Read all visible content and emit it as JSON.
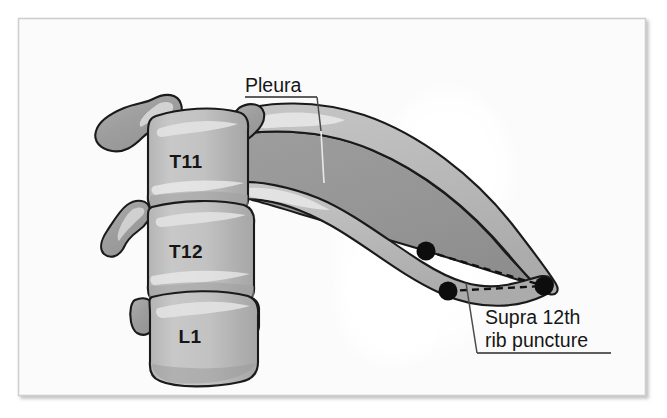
{
  "figure": {
    "title": "Supra 12th rib puncture",
    "frame": {
      "background_color": "#fbfbfb",
      "border_color": "#cfcfcf",
      "page_color": "#ffffff"
    }
  },
  "palette": {
    "bone_light": "#c2c2c2",
    "bone_mid": "#b2b2b2",
    "bone_dark": "#9b9b9b",
    "pleura_fill": "#969696",
    "rib_fill": "#b9b9b9",
    "highlight": "#eaeaea",
    "outline": "#1a1a1a",
    "dot_color": "#0d0d0d",
    "text_color": "#161616",
    "halo_white": "#ffffff"
  },
  "vertebrae": [
    {
      "id": "t11",
      "label": "T11",
      "x": 186,
      "y": 168
    },
    {
      "id": "t12",
      "label": "T12",
      "x": 186,
      "y": 258
    },
    {
      "id": "l1",
      "label": "L1",
      "x": 190,
      "y": 343
    }
  ],
  "callouts": [
    {
      "id": "pleura",
      "lines": [
        "Pleura"
      ],
      "text_x": 245,
      "text_baseline": 92,
      "underline": {
        "x1": 245,
        "x2": 317,
        "y": 97
      },
      "leader": {
        "x1": 317,
        "y1": 97,
        "x2": 323,
        "y2": 182
      },
      "anchor_target": "pleura-dark-region"
    },
    {
      "id": "supra-12th-rib-puncture",
      "lines": [
        "Supra 12th",
        "rib puncture"
      ],
      "text_x": 485,
      "text_baseline": 324,
      "line_height": 23,
      "underline": {
        "x1": 477,
        "x2": 611,
        "y": 353
      },
      "leader": {
        "x1": 477,
        "y1": 353,
        "x2": 466,
        "y2": 283
      },
      "anchor_target": "rib-tip-dot"
    }
  ],
  "puncture_points": [
    {
      "id": "upper-needle-dot",
      "cx": 426,
      "cy": 251,
      "r": 9.5
    },
    {
      "id": "lower-needle-dot",
      "cx": 448,
      "cy": 291,
      "r": 9.5
    },
    {
      "id": "rib-tip-dot",
      "cx": 544,
      "cy": 286,
      "r": 9.5
    }
  ],
  "trajectories": [
    {
      "id": "upper-trajectory",
      "from": "upper-needle-dot",
      "to": "rib-tip-dot",
      "style": "dashed"
    },
    {
      "id": "lower-trajectory",
      "from": "lower-needle-dot",
      "to": "rib-tip-dot",
      "style": "dashed"
    }
  ],
  "structures": [
    {
      "id": "pleura-dark-region",
      "name": "Pleura",
      "fill": "#969696"
    },
    {
      "id": "rib-11",
      "name": "11th rib",
      "fill": "#b9b9b9"
    },
    {
      "id": "rib-12",
      "name": "12th rib",
      "fill": "#b9b9b9"
    },
    {
      "id": "vertebral-column",
      "name": "Vertebral bodies T11 T12 L1",
      "fill": "#c2c2c2"
    },
    {
      "id": "transverse-processes",
      "name": "Transverse processes",
      "fill": "#a0a0a0"
    },
    {
      "id": "kidney-halo",
      "name": "Kidney silhouette halo",
      "fill": "#ffffff"
    }
  ]
}
